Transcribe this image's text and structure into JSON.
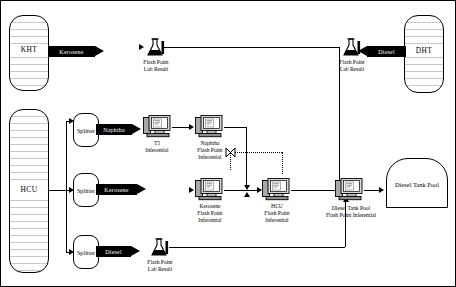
{
  "diagram": {
    "tanks": [
      {
        "id": "kht",
        "label": "KHT"
      },
      {
        "id": "hcu",
        "label": "HCU"
      },
      {
        "id": "dht",
        "label": "DHT"
      }
    ],
    "pool_tank": {
      "label": "Diesel Tank Pool"
    },
    "splitters": [
      {
        "id": "splitter-naphtha",
        "label": "Splitter"
      },
      {
        "id": "splitter-kerosene",
        "label": "Splitter"
      },
      {
        "id": "splitter-diesel",
        "label": "Splitter"
      }
    ],
    "streams": [
      {
        "id": "kht-kerosene",
        "label": "Kerosene",
        "direction": "right"
      },
      {
        "id": "dht-diesel",
        "label": "Diesel",
        "direction": "left"
      },
      {
        "id": "splitter-naphtha-out",
        "label": "Naphtha",
        "direction": "right"
      },
      {
        "id": "splitter-kerosene-out",
        "label": "Kerosene",
        "direction": "right"
      },
      {
        "id": "splitter-diesel-out",
        "label": "Diesel",
        "direction": "right"
      }
    ],
    "lab_results": [
      {
        "id": "lab-kht",
        "line1": "Flash Point",
        "line2": "Lab Result"
      },
      {
        "id": "lab-dht",
        "line1": "Flash Point",
        "line2": "Lab Result"
      },
      {
        "id": "lab-diesel",
        "line1": "Flash Point",
        "line2": "Lab Result"
      }
    ],
    "inferentials": [
      {
        "id": "t5-inferential",
        "line1": "T5",
        "line2": "Inferential",
        "line3": ""
      },
      {
        "id": "naphtha-inferential",
        "line1": "Naphtha",
        "line2": "Flash Point",
        "line3": "Inferential"
      },
      {
        "id": "kerosene-inferential",
        "line1": "Kerosene",
        "line2": "Flash Point",
        "line3": "Inferential"
      },
      {
        "id": "hcu-inferential",
        "line1": "HCU",
        "line2": "Flash Point",
        "line3": "Inferential"
      },
      {
        "id": "diesel-pool-inferential",
        "line1": "Diesel Tank Pool",
        "line2": "Flash Point Inferential",
        "line3": ""
      }
    ],
    "colors": {
      "line": "#000000",
      "background": "#ffffff",
      "arrow_fill": "#000000",
      "arrow_text": "#ffffff"
    }
  }
}
